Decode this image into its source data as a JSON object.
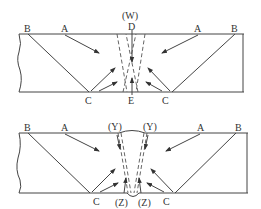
{
  "diagrams": [
    {
      "id": "top",
      "labels": {
        "B_left": "B",
        "A_left": "A",
        "C_left": "C",
        "W": "(W)",
        "D": "D",
        "E": "E",
        "C_right": "C",
        "A_right": "A",
        "B_right": "B"
      }
    },
    {
      "id": "bottom",
      "labels": {
        "B_left": "B",
        "A_left": "A",
        "C_left": "C",
        "Y_left": "(Y)",
        "Y_right": "(Y)",
        "Z_left": "(Z)",
        "Z_right": "(Z)",
        "C_right": "C",
        "A_right": "A",
        "B_right": "B"
      }
    }
  ]
}
